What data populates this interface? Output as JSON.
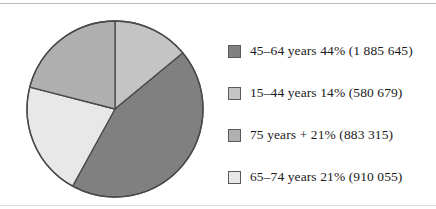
{
  "chart_data": {
    "type": "pie",
    "title": "",
    "xlabel": "",
    "ylabel": "",
    "legend_position": "right",
    "grid": false,
    "start_angle_deg": 0,
    "direction": "clockwise",
    "categories": [
      "45–64 years",
      "15–44 years",
      "75 years +",
      "65–74 years"
    ],
    "values": [
      44,
      14,
      21,
      21
    ],
    "counts": [
      1885645,
      883315,
      910055,
      580679
    ],
    "slices": [
      {
        "label": "45–64 years",
        "percent": 44,
        "count": 1885645,
        "count_display": "1 885 645",
        "legend_text": "45–64 years 44% (1 885 645)",
        "color": "#808080",
        "order": 2
      },
      {
        "label": "15–44 years",
        "percent": 14,
        "count": 580679,
        "count_display": "580 679",
        "legend_text": "15–44 years 14% (580 679)",
        "color": "#c4c4c4",
        "order": 1
      },
      {
        "label": "75 years +",
        "percent": 21,
        "count": 883315,
        "count_display": "883 315",
        "legend_text": "75 years + 21% (883 315)",
        "color": "#b0b0b0",
        "order": 4
      },
      {
        "label": "65–74 years",
        "percent": 21,
        "count": 910055,
        "count_display": "910 055",
        "legend_text": "65–74 years 21% (910 055)",
        "color": "#e8e8e8",
        "order": 3
      }
    ]
  },
  "legend": {
    "items": [
      {
        "text": "45–64 years 44% (1 885 645)",
        "color": "#808080"
      },
      {
        "text": "15–44 years 14% (580 679)",
        "color": "#c4c4c4"
      },
      {
        "text": "75 years + 21% (883 315)",
        "color": "#b0b0b0"
      },
      {
        "text": "65–74 years 21% (910 055)",
        "color": "#e8e8e8"
      }
    ]
  },
  "style": {
    "outline_color": "#4a4a4a",
    "rule_color": "#b9b9b9",
    "background": "#ffffff"
  }
}
